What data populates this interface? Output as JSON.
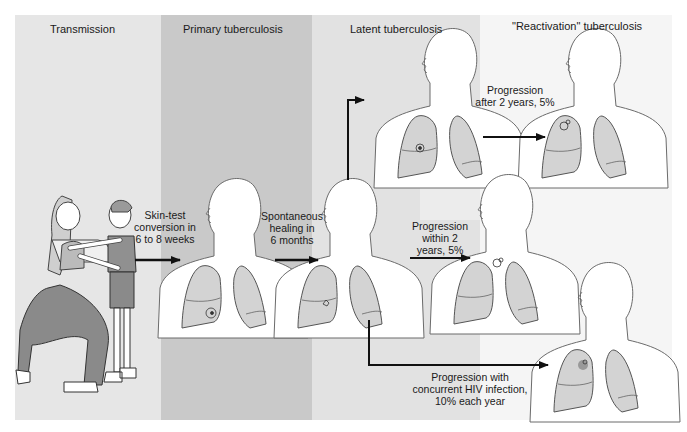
{
  "panels": [
    {
      "id": "transmission",
      "title": "Transmission",
      "color": "#e6e6e6"
    },
    {
      "id": "primary",
      "title": "Primary tuberculosis",
      "color": "#c9c9c9"
    },
    {
      "id": "latent",
      "title": "Latent tuberculosis",
      "color": "#e2e2e2"
    },
    {
      "id": "reactivation",
      "title": "\"Reactivation\" tuberculosis",
      "color": "#f5f5f5"
    }
  ],
  "arrows": {
    "skin_test": {
      "line1": "Skin-test",
      "line2": "conversion in",
      "line3": "6 to 8 weeks"
    },
    "healing": {
      "line1": "Spontaneous",
      "line2": "healing in",
      "line3": "6 months"
    },
    "after_2_years": {
      "line1": "Progression",
      "line2": "after 2 years, 5%"
    },
    "within_2_years": {
      "line1": "Progression",
      "line2": "within 2",
      "line3": "years, 5%"
    },
    "hiv": {
      "line1": "Progression with",
      "line2": "concurrent HIV infection,",
      "line3": "10% each year"
    }
  },
  "figures": [
    {
      "id": "adult-child",
      "description": "Adult kneeling holding child (transmission)"
    },
    {
      "id": "primary-torso",
      "lesion": "lower right lung focus"
    },
    {
      "id": "latent-torso-upper",
      "lesion": "calcified focus"
    },
    {
      "id": "latent-torso-lower",
      "lesion": "healed focus"
    },
    {
      "id": "reactivation-upper",
      "lesion": "apical cavity"
    },
    {
      "id": "reactivation-middle",
      "lesion": "apical lesion"
    },
    {
      "id": "reactivation-lower",
      "lesion": "lower-zone lesion"
    }
  ]
}
